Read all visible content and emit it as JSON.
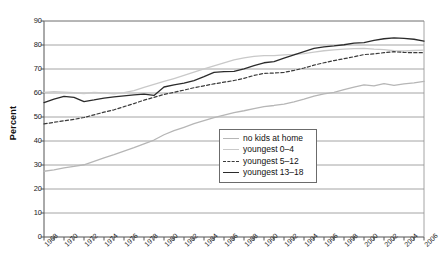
{
  "chart_data": {
    "type": "line",
    "title": "",
    "xlabel": "",
    "ylabel": "Percent",
    "xlim": [
      1968,
      2006
    ],
    "ylim": [
      0,
      90
    ],
    "ytick_step": 10,
    "xtick_step": 1,
    "xticklabel_step": 2,
    "grid": "horizontal",
    "legend_position": "center-right",
    "yticks": [
      0,
      10,
      20,
      30,
      40,
      50,
      60,
      70,
      80,
      90
    ],
    "x": [
      1968,
      1969,
      1970,
      1971,
      1972,
      1973,
      1974,
      1975,
      1976,
      1977,
      1978,
      1979,
      1980,
      1981,
      1982,
      1983,
      1984,
      1985,
      1986,
      1987,
      1988,
      1989,
      1990,
      1991,
      1992,
      1993,
      1994,
      1995,
      1996,
      1997,
      1998,
      1999,
      2000,
      2001,
      2002,
      2003,
      2004,
      2005,
      2006
    ],
    "xticklabels": [
      "1968",
      "1970",
      "1972",
      "1974",
      "1976",
      "1978",
      "1980",
      "1982",
      "1984",
      "1986",
      "1988",
      "1990",
      "1992",
      "1994",
      "1996",
      "1998",
      "2000",
      "2002",
      "2004",
      "2006"
    ],
    "series": [
      {
        "name": "no kids at home",
        "style": "solid",
        "color": "#b6b6b6",
        "values": [
          27.4,
          28.0,
          28.8,
          29.4,
          30.1,
          31.5,
          33.0,
          34.3,
          35.8,
          37.2,
          38.8,
          40.4,
          42.6,
          44.3,
          45.7,
          47.2,
          48.5,
          49.7,
          50.8,
          51.8,
          52.6,
          53.5,
          54.3,
          54.8,
          55.4,
          56.3,
          57.4,
          58.7,
          59.6,
          60.3,
          61.4,
          62.4,
          63.4,
          63.0,
          63.9,
          63.2,
          63.8,
          64.2,
          64.8
        ]
      },
      {
        "name": "youngest 0–4",
        "style": "solid",
        "color": "#c9c9c9",
        "values": [
          60.2,
          60.6,
          60.4,
          60.1,
          59.8,
          60.3,
          60.0,
          59.6,
          60.2,
          61.0,
          62.3,
          63.6,
          64.8,
          66.0,
          67.3,
          68.7,
          70.1,
          71.3,
          72.6,
          73.8,
          74.6,
          75.3,
          75.6,
          75.6,
          75.9,
          76.1,
          76.4,
          77.0,
          77.6,
          78.0,
          78.3,
          78.5,
          78.6,
          78.3,
          78.1,
          77.6,
          77.5,
          77.7,
          77.9
        ]
      },
      {
        "name": "youngest 5–12",
        "style": "dashed",
        "color": "#3a3a3a",
        "values": [
          47.1,
          47.8,
          48.4,
          49.0,
          49.8,
          50.9,
          52.0,
          53.0,
          54.3,
          55.6,
          57.0,
          58.2,
          59.4,
          60.3,
          61.2,
          62.2,
          63.0,
          63.8,
          64.5,
          65.2,
          66.1,
          67.3,
          68.2,
          68.3,
          68.6,
          69.4,
          70.4,
          71.6,
          72.6,
          73.5,
          74.3,
          75.1,
          76.0,
          76.3,
          76.8,
          77.2,
          76.9,
          76.8,
          76.8
        ]
      },
      {
        "name": "youngest 13–18",
        "style": "solid",
        "color": "#2b2b2b",
        "values": [
          56.0,
          57.4,
          58.6,
          58.2,
          56.4,
          57.1,
          57.9,
          58.4,
          58.8,
          59.2,
          59.5,
          59.0,
          62.5,
          63.4,
          64.1,
          65.2,
          66.8,
          68.6,
          68.9,
          69.0,
          70.1,
          71.4,
          72.6,
          73.1,
          74.5,
          75.9,
          77.2,
          78.6,
          79.2,
          79.6,
          80.1,
          80.8,
          81.0,
          81.9,
          82.6,
          83.0,
          82.8,
          82.4,
          81.6
        ]
      }
    ]
  },
  "legend": {
    "items": [
      {
        "label": "no kids at home"
      },
      {
        "label": "youngest 0–4"
      },
      {
        "label": "youngest 5–12"
      },
      {
        "label": "youngest 13–18"
      }
    ]
  }
}
